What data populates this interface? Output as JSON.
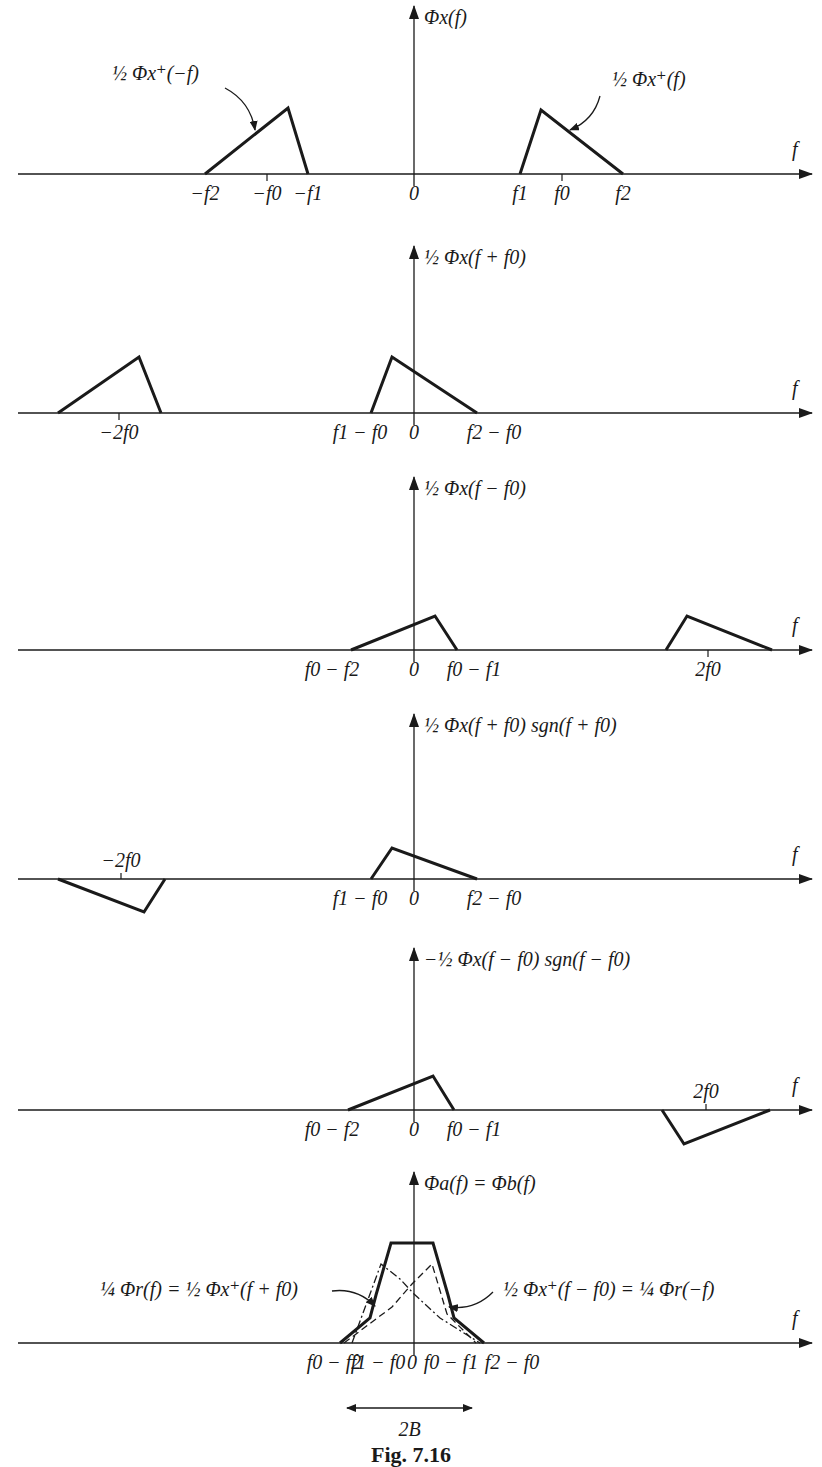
{
  "caption": "Fig. 7.16",
  "colors": {
    "ink": "#1a1a1a",
    "background": "#ffffff"
  },
  "axis": {
    "x_start": 18,
    "x_end": 812,
    "zero_x": 414
  },
  "panels": [
    {
      "id": "phi-x",
      "axis_y": 174,
      "arrow_top": 6,
      "ylabel": "Φx(f)",
      "f_label": "f",
      "shapes": [
        {
          "points": [
            [
              205,
              174
            ],
            [
              288,
              108
            ],
            [
              308,
              174
            ]
          ],
          "style": "solid"
        },
        {
          "points": [
            [
              520,
              174
            ],
            [
              541,
              110
            ],
            [
              623,
              174
            ]
          ],
          "style": "solid"
        }
      ],
      "ticks": [
        {
          "x": 205,
          "label": "−f2"
        },
        {
          "x": 267,
          "label": "−f0",
          "mark": true
        },
        {
          "x": 308,
          "label": "−f1"
        },
        {
          "x": 414,
          "label": "0"
        },
        {
          "x": 520,
          "label": "f1"
        },
        {
          "x": 562,
          "label": "f0",
          "mark": true
        },
        {
          "x": 623,
          "label": "f2"
        }
      ],
      "annotations": [
        {
          "text": "½ Φx⁺(−f)",
          "x": 112,
          "y": 80,
          "arrow": [
            [
              225,
              88
            ],
            [
              255,
              130
            ]
          ]
        },
        {
          "text": "½ Φx⁺(f)",
          "x": 612,
          "y": 86,
          "arrow": [
            [
              600,
              96
            ],
            [
              570,
              130
            ]
          ]
        }
      ]
    },
    {
      "id": "phi-x-plus-f0",
      "axis_y": 413,
      "arrow_top": 246,
      "ylabel": "½ Φx(f + f0)",
      "f_label": "f",
      "shapes": [
        {
          "points": [
            [
              58,
              413
            ],
            [
              139,
              357
            ],
            [
              161,
              413
            ]
          ],
          "style": "solid"
        },
        {
          "points": [
            [
              371,
              413
            ],
            [
              392,
              357
            ],
            [
              477,
              413
            ]
          ],
          "style": "solid"
        }
      ],
      "ticks": [
        {
          "x": 119,
          "label": "−2f0",
          "mark": true
        },
        {
          "x": 360,
          "label": "f1 − f0"
        },
        {
          "x": 414,
          "label": "0"
        },
        {
          "x": 494,
          "label": "f2 − f0"
        }
      ],
      "annotations": []
    },
    {
      "id": "phi-x-minus-f0",
      "axis_y": 650,
      "arrow_top": 477,
      "ylabel": "½ Φx(f − f0)",
      "f_label": "f",
      "shapes": [
        {
          "points": [
            [
              351,
              650
            ],
            [
              435,
              616
            ],
            [
              457,
              650
            ]
          ],
          "style": "solid"
        },
        {
          "points": [
            [
              666,
              650
            ],
            [
              687,
              616
            ],
            [
              772,
              650
            ]
          ],
          "style": "solid"
        }
      ],
      "ticks": [
        {
          "x": 332,
          "label": "f0 − f2"
        },
        {
          "x": 414,
          "label": "0"
        },
        {
          "x": 474,
          "label": "f0 − f1"
        },
        {
          "x": 708,
          "label": "2f0",
          "mark": true
        }
      ],
      "annotations": []
    },
    {
      "id": "phi-x-plus-f0-sgn",
      "axis_y": 879,
      "arrow_top": 714,
      "ylabel": "½ Φx(f + f0) sgn(f + f0)",
      "f_label": "f",
      "shapes": [
        {
          "points": [
            [
              58,
              879
            ],
            [
              144,
              912
            ],
            [
              165,
              879
            ]
          ],
          "style": "solid"
        },
        {
          "points": [
            [
              371,
              879
            ],
            [
              392,
              848
            ],
            [
              477,
              879
            ]
          ],
          "style": "solid"
        }
      ],
      "ticks": [
        {
          "x": 360,
          "label": "f1 − f0"
        },
        {
          "x": 414,
          "label": "0"
        },
        {
          "x": 494,
          "label": "f2 − f0"
        }
      ],
      "top_ticks": [
        {
          "x": 121,
          "label": "−2f0"
        }
      ],
      "annotations": []
    },
    {
      "id": "neg-phi-x-minus-f0-sgn",
      "axis_y": 1110,
      "arrow_top": 948,
      "ylabel": "−½ Φx(f − f0) sgn(f − f0)",
      "f_label": "f",
      "shapes": [
        {
          "points": [
            [
              348,
              1110
            ],
            [
              433,
              1076
            ],
            [
              454,
              1110
            ]
          ],
          "style": "solid"
        },
        {
          "points": [
            [
              662,
              1110
            ],
            [
              684,
              1144
            ],
            [
              770,
              1110
            ]
          ],
          "style": "solid"
        }
      ],
      "ticks": [
        {
          "x": 332,
          "label": "f0 − f2"
        },
        {
          "x": 414,
          "label": "0"
        },
        {
          "x": 474,
          "label": "f0 − f1"
        }
      ],
      "top_ticks": [
        {
          "x": 706,
          "label": "2f0"
        }
      ],
      "annotations": []
    },
    {
      "id": "phi-a-equals-phi-b",
      "axis_y": 1343,
      "arrow_top": 1172,
      "ylabel": "Φa(f) = Φb(f)",
      "f_label": "f",
      "shapes": [
        {
          "points": [
            [
              340,
              1343
            ],
            [
              370,
              1318
            ],
            [
              376,
              1295
            ],
            [
              391,
              1243
            ],
            [
              433,
              1243
            ],
            [
              448,
              1295
            ],
            [
              454,
              1318
            ],
            [
              484,
              1343
            ]
          ],
          "style": "solid"
        },
        {
          "points": [
            [
              344,
              1343
            ],
            [
              392,
              1307
            ],
            [
              412,
              1284
            ],
            [
              432,
              1264
            ],
            [
              447,
              1314
            ],
            [
              476,
              1343
            ]
          ],
          "style": "dashed"
        },
        {
          "points": [
            [
              352,
              1343
            ],
            [
              381,
              1264
            ],
            [
              400,
              1279
            ],
            [
              414,
              1294
            ],
            [
              440,
              1318
            ],
            [
              480,
              1343
            ]
          ],
          "style": "dashdot"
        }
      ],
      "ticks": [
        {
          "x": 334,
          "label": "f0 − f2"
        },
        {
          "x": 378,
          "label": "f1 − f0"
        },
        {
          "x": 412,
          "label": "0"
        },
        {
          "x": 451,
          "label": "f0 − f1"
        },
        {
          "x": 512,
          "label": "f2 − f0"
        }
      ],
      "annotations": [
        {
          "text": "¼ Φr(f) = ½ Φx⁺(f + f0)",
          "x": 100,
          "y": 1296,
          "arrow": [
            [
              332,
              1291
            ],
            [
              375,
              1306
            ]
          ]
        },
        {
          "text": "½ Φx⁺(f − f0) = ¼ Φr(−f)",
          "x": 503,
          "y": 1296,
          "arrow": [
            [
              493,
              1292
            ],
            [
              449,
              1307
            ]
          ]
        }
      ],
      "bandwidth": {
        "label": "2B",
        "x1": 347,
        "x2": 472,
        "y": 1408
      }
    }
  ]
}
